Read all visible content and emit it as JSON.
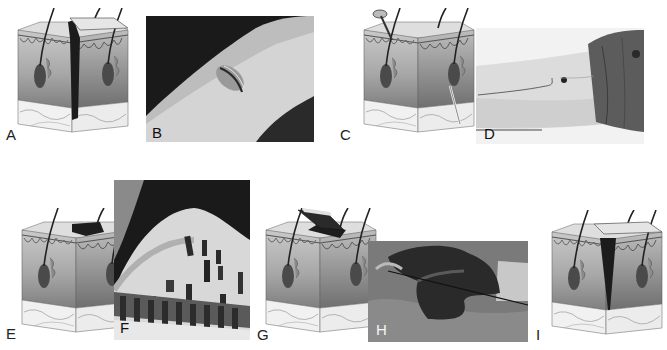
{
  "figure": {
    "panels": [
      {
        "id": "A",
        "type": "skin-diagram",
        "depicts": "laceration through epidermis and dermis"
      },
      {
        "id": "B",
        "type": "photo",
        "depicts": "laceration wound on limb"
      },
      {
        "id": "C",
        "type": "skin-diagram",
        "depicts": "puncture wound with nail / needle"
      },
      {
        "id": "D",
        "type": "photo",
        "depicts": "forearm with puncture wound and linear streak"
      },
      {
        "id": "E",
        "type": "skin-diagram",
        "depicts": "superficial abrasion / burn of epidermis"
      },
      {
        "id": "F",
        "type": "photo",
        "depicts": "patterned contusions on skin"
      },
      {
        "id": "G",
        "type": "skin-diagram",
        "depicts": "avulsion flap of skin"
      },
      {
        "id": "H",
        "type": "photo",
        "depicts": "degloving avulsion injury of hand"
      },
      {
        "id": "I",
        "type": "skin-diagram",
        "depicts": "incision / deep wedge-shaped cut"
      }
    ],
    "labels": {
      "A": "A",
      "B": "B",
      "C": "C",
      "D": "D",
      "E": "E",
      "F": "F",
      "G": "G",
      "H": "H",
      "I": "I"
    },
    "colors": {
      "background": "#ffffff",
      "epidermis": "#d9d9d9",
      "dermis_top": "#bdbdbd",
      "dermis_bottom": "#8f8f8f",
      "subcutis": "#efefef",
      "hair": "#2a2a2a",
      "wound": "#1c1c1c"
    }
  }
}
